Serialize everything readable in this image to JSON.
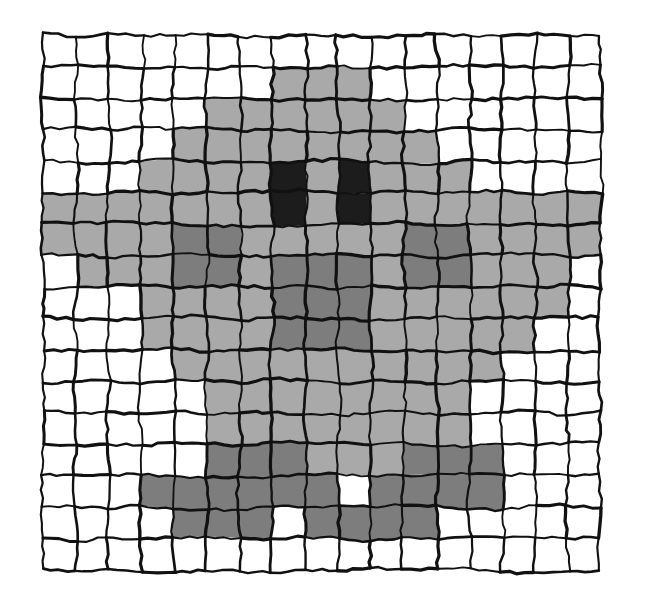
{
  "figure": {
    "title": "",
    "kind": "hand-drawn pixel grid",
    "description": "Hand-drawn wobbly grid of squares with some cells shaded in grey tones forming a face-like pattern"
  },
  "canvas": {
    "width": 661,
    "height": 613,
    "background": "#ffffff"
  },
  "chart_data": {
    "type": "heatmap",
    "title": "",
    "subtitle": "",
    "xlabel": "",
    "ylabel": "",
    "grid": true,
    "legend": "none",
    "rows": 17,
    "cols": 17,
    "x": [
      0,
      1,
      2,
      3,
      4,
      5,
      6,
      7,
      8,
      9,
      10,
      11,
      12,
      13,
      14,
      15,
      16
    ],
    "y": [
      0,
      1,
      2,
      3,
      4,
      5,
      6,
      7,
      8,
      9,
      10,
      11,
      12,
      13,
      14,
      15,
      16
    ],
    "tick_labels_x": [],
    "tick_labels_y": [],
    "value_palette": {
      "0": "#ffffff",
      "1": "#a9a9a9",
      "2": "#7d7d7d",
      "3": "#1c1c1c"
    },
    "value_names": {
      "0": "white",
      "1": "light-grey",
      "2": "mid-grey",
      "3": "near-black"
    },
    "values": [
      [
        0,
        0,
        0,
        0,
        0,
        0,
        0,
        0,
        0,
        0,
        0,
        0,
        0,
        0,
        0,
        0,
        0
      ],
      [
        0,
        0,
        0,
        0,
        0,
        0,
        0,
        1,
        1,
        1,
        0,
        0,
        0,
        0,
        0,
        0,
        0
      ],
      [
        0,
        0,
        0,
        0,
        0,
        1,
        1,
        1,
        1,
        1,
        1,
        0,
        0,
        0,
        0,
        0,
        0
      ],
      [
        0,
        0,
        0,
        0,
        1,
        1,
        1,
        1,
        1,
        1,
        1,
        1,
        0,
        0,
        0,
        0,
        0
      ],
      [
        0,
        0,
        0,
        1,
        1,
        1,
        1,
        3,
        1,
        3,
        1,
        1,
        1,
        0,
        0,
        0,
        0
      ],
      [
        1,
        1,
        1,
        1,
        1,
        1,
        1,
        3,
        1,
        3,
        1,
        1,
        1,
        1,
        1,
        1,
        1
      ],
      [
        1,
        1,
        1,
        1,
        2,
        2,
        1,
        1,
        1,
        1,
        1,
        2,
        2,
        1,
        1,
        1,
        1
      ],
      [
        0,
        1,
        1,
        1,
        2,
        2,
        1,
        2,
        2,
        2,
        1,
        2,
        2,
        1,
        1,
        1,
        0
      ],
      [
        0,
        0,
        0,
        1,
        1,
        1,
        1,
        2,
        2,
        2,
        1,
        1,
        1,
        1,
        1,
        1,
        0
      ],
      [
        0,
        0,
        0,
        1,
        1,
        1,
        1,
        2,
        2,
        2,
        1,
        1,
        1,
        1,
        1,
        0,
        0
      ],
      [
        0,
        0,
        0,
        0,
        1,
        1,
        1,
        1,
        1,
        1,
        1,
        1,
        1,
        1,
        0,
        0,
        0
      ],
      [
        0,
        0,
        0,
        0,
        0,
        1,
        1,
        1,
        1,
        1,
        1,
        1,
        1,
        0,
        0,
        0,
        0
      ],
      [
        0,
        0,
        0,
        0,
        0,
        1,
        1,
        1,
        1,
        1,
        1,
        1,
        1,
        0,
        0,
        0,
        0
      ],
      [
        0,
        0,
        0,
        0,
        0,
        2,
        2,
        2,
        1,
        1,
        1,
        2,
        2,
        2,
        0,
        0,
        0
      ],
      [
        0,
        0,
        0,
        2,
        2,
        2,
        2,
        2,
        2,
        0,
        2,
        2,
        2,
        2,
        0,
        0,
        0
      ],
      [
        0,
        0,
        0,
        0,
        2,
        2,
        2,
        0,
        2,
        2,
        2,
        2,
        0,
        0,
        0,
        0,
        0
      ],
      [
        0,
        0,
        0,
        0,
        0,
        0,
        0,
        0,
        0,
        0,
        0,
        0,
        0,
        0,
        0,
        0,
        0
      ]
    ]
  },
  "render": {
    "grid_origin_x": 43,
    "grid_origin_y": 35,
    "cell_width": 32.8,
    "cell_height": 31.5,
    "line_color": "#111111",
    "line_width": 2.6,
    "jitter_amount": 2.6,
    "jitter_seed": 20240513
  }
}
